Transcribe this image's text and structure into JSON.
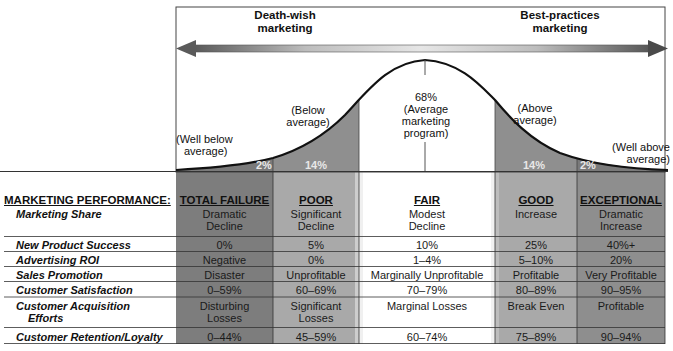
{
  "diagram": {
    "arrow": {
      "left_label": "Death-wish\nmarketing",
      "right_label": "Best-practices\nmarketing"
    },
    "curve": {
      "type": "bell curve (normal distribution)",
      "segments": [
        {
          "label": "(Well below average)",
          "percent": "2%"
        },
        {
          "label": "(Below average)",
          "percent": "14%"
        },
        {
          "label": "68% (Average marketing program)",
          "percent": "68%"
        },
        {
          "label": "(Above average)",
          "percent": "14%"
        },
        {
          "label": "(Well above average)",
          "percent": "2%"
        }
      ],
      "labels": {
        "well_below_1": "(Well below",
        "well_below_2": "average)",
        "below_1": "(Below",
        "below_2": "average)",
        "avg_pct": "68%",
        "avg_1": "(Average",
        "avg_2": "marketing",
        "avg_3": "program)",
        "above_1": "(Above",
        "above_2": "average)",
        "well_above_1": "(Well above",
        "well_above_2": "average)",
        "pct_wb": "2%",
        "pct_b": "14%",
        "pct_a": "14%",
        "pct_wa": "2%"
      }
    },
    "colors": {
      "dark_band": "#7a7a7a",
      "mid_band": "#a6a6a6",
      "fair_band": "#ffffff",
      "line": "#222222"
    }
  },
  "table": {
    "title": "MARKETING PERFORMANCE:",
    "columns": [
      "TOTAL FAILURE",
      "POOR",
      "FAIR",
      "GOOD",
      "EXCEPTIONAL"
    ],
    "rows": [
      {
        "label": "Marketing Share",
        "values": [
          "Dramatic\nDecline",
          "Significant\nDecline",
          "Modest\nDecline",
          "Increase",
          "Dramatic\nIncrease"
        ]
      },
      {
        "label": "New Product Success",
        "values": [
          "0%",
          "5%",
          "10%",
          "25%",
          "40%+"
        ]
      },
      {
        "label": "Advertising ROI",
        "values": [
          "Negative",
          "0%",
          "1–4%",
          "5–10%",
          "20%"
        ]
      },
      {
        "label": "Sales Promotion",
        "values": [
          "Disaster",
          "Unprofitable",
          "Marginally Unprofitable",
          "Profitable",
          "Very Profitable"
        ]
      },
      {
        "label": "Customer Satisfaction",
        "values": [
          "0–59%",
          "60–69%",
          "70–79%",
          "80–89%",
          "90–95%"
        ]
      },
      {
        "label": "Customer Acquisition\n  Efforts",
        "values": [
          "Disturbing\nLosses",
          "Significant\nLosses",
          "Marginal Losses",
          "Break Even",
          "Profitable"
        ]
      },
      {
        "label": "Customer Retention/Loyalty",
        "values": [
          "0–44%",
          "45–59%",
          "60–74%",
          "75–89%",
          "90–94%"
        ]
      }
    ],
    "cells": {
      "ms": {
        "label_1": "Marketing Share",
        "tf_1": "Dramatic",
        "tf_2": "Decline",
        "po_1": "Significant",
        "po_2": "Decline",
        "fa_1": "Modest",
        "fa_2": "Decline",
        "go_1": "Increase",
        "ex_1": "Dramatic",
        "ex_2": "Increase"
      },
      "nps": {
        "label": "New Product Success",
        "tf": "0%",
        "po": "5%",
        "fa": "10%",
        "go": "25%",
        "ex": "40%+"
      },
      "roi": {
        "label": "Advertising ROI",
        "tf": "Negative",
        "po": "0%",
        "fa": "1–4%",
        "go": "5–10%",
        "ex": "20%"
      },
      "sp": {
        "label": "Sales Promotion",
        "tf": "Disaster",
        "po": "Unprofitable",
        "fa": "Marginally Unprofitable",
        "go": "Profitable",
        "ex": "Very Profitable"
      },
      "cs": {
        "label": "Customer Satisfaction",
        "tf": "0–59%",
        "po": "60–69%",
        "fa": "70–79%",
        "go": "80–89%",
        "ex": "90–95%"
      },
      "cae": {
        "label_1": "Customer Acquisition",
        "label_2": "Efforts",
        "tf_1": "Disturbing",
        "tf_2": "Losses",
        "po_1": "Significant",
        "po_2": "Losses",
        "fa": "Marginal Losses",
        "go": "Break Even",
        "ex": "Profitable"
      },
      "crl": {
        "label": "Customer Retention/Loyalty",
        "tf": "0–44%",
        "po": "45–59%",
        "fa": "60–74%",
        "go": "75–89%",
        "ex": "90–94%"
      }
    }
  }
}
